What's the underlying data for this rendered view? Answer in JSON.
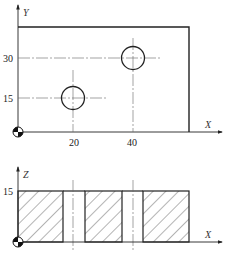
{
  "top_view": {
    "y_axis_label": "Y",
    "x_axis_label": "X",
    "y_ticks": [
      "30",
      "15"
    ],
    "x_ticks": [
      "20",
      "40"
    ],
    "holes": [
      {
        "x": 20,
        "y": 15
      },
      {
        "x": 40,
        "y": 30
      }
    ],
    "origin_symbol": "datum-origin-icon"
  },
  "front_view": {
    "z_axis_label": "Z",
    "x_axis_label": "X",
    "z_ticks": [
      "15"
    ],
    "origin_symbol": "datum-origin-icon"
  },
  "colors": {
    "line": "#222222",
    "centerline": "#555555",
    "hatch": "#444444"
  }
}
